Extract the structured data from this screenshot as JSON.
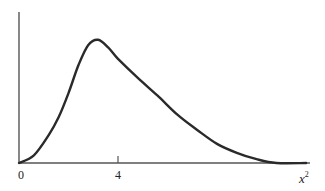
{
  "chart_data": {
    "type": "line",
    "title": "",
    "xlabel": "x",
    "xlabel_superscript": "2",
    "ylabel": "",
    "x_ticks": [
      {
        "value": 0,
        "label": "0"
      },
      {
        "value": 4,
        "label": "4"
      }
    ],
    "xlim": [
      0,
      11.6
    ],
    "ylim": [
      0,
      1
    ],
    "grid": false,
    "legend": null,
    "series": [
      {
        "name": "chi-square density",
        "x": [
          0,
          0.6,
          1.2,
          1.6,
          2.0,
          2.4,
          2.8,
          3.2,
          3.6,
          4.0,
          4.8,
          5.6,
          6.4,
          7.2,
          8.0,
          8.8,
          9.6,
          10.4,
          11.6
        ],
        "y": [
          0.0,
          0.06,
          0.22,
          0.36,
          0.55,
          0.77,
          0.93,
          0.97,
          0.91,
          0.82,
          0.67,
          0.53,
          0.38,
          0.26,
          0.15,
          0.08,
          0.03,
          0.0,
          0.0
        ]
      }
    ],
    "colors": {
      "curve": "#2a2a2a",
      "axis": "#555555",
      "background": "#ffffff"
    }
  }
}
